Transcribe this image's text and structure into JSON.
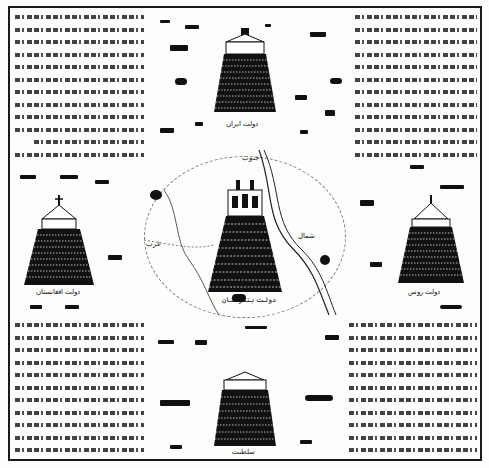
{
  "plate": {
    "background": "#fdfdfb",
    "ink": "#111111"
  },
  "text_panels": {
    "top_left": {
      "label": "Urdu/Persian descriptive text panel (top-left)",
      "lines": 18
    },
    "top_right": {
      "label": "Urdu/Persian descriptive text panel (top-right)",
      "lines": 19
    },
    "bottom_left": {
      "label": "Urdu/Persian descriptive text panel (bottom-left)",
      "lines": 17
    },
    "bottom_right": {
      "label": "Urdu/Persian descriptive text panel (bottom-right)",
      "lines": 17
    }
  },
  "towers": {
    "top": {
      "caption": "دولت ایران"
    },
    "left": {
      "caption": "دولت افغانستان"
    },
    "center": {
      "caption": "دولت ہندوستان"
    },
    "right": {
      "caption": "دولت روس"
    },
    "bottom": {
      "caption": "سلطنت"
    }
  },
  "central_map": {
    "compass": {
      "north": "شمال",
      "south": "جنوب",
      "west": "غرب"
    }
  }
}
